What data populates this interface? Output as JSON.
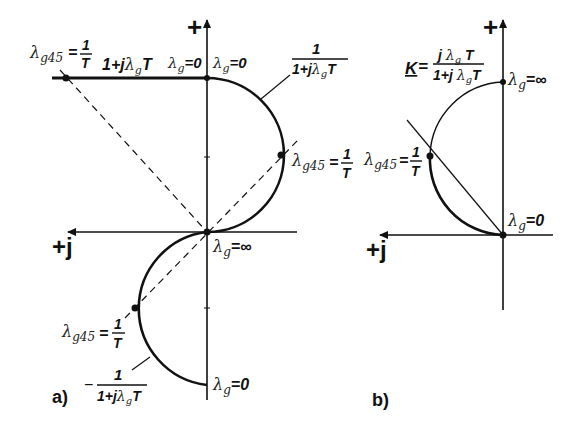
{
  "diagram_a": {
    "caption": "a)",
    "axis_up_label": "+",
    "axis_left_label": "+j",
    "top_line_label": "1+jλgT",
    "top_left_point": {
      "lambda": "λg45",
      "eq": "=",
      "num": "1",
      "den": "T"
    },
    "origin_top_label_left": "λg=0",
    "origin_top_label_right": "λg=0",
    "upper_curve": {
      "num": "1",
      "den": "1+jλgT"
    },
    "upper_point": {
      "lambda": "λg45",
      "eq": "=",
      "num": "1",
      "den": "T"
    },
    "center_label": "λg=∞",
    "lower_point": {
      "lambda": "λg45",
      "eq": "=",
      "num": "1",
      "den": "T"
    },
    "lower_curve": {
      "sign": "−",
      "num": "1",
      "den": "1+jλgT"
    },
    "bottom_label": "λg=0"
  },
  "diagram_b": {
    "caption": "b)",
    "axis_up_label": "+",
    "axis_left_label": "+j",
    "formula": {
      "K": "K",
      "eq": "=",
      "num": "jλgT",
      "den": "1+jλgT"
    },
    "top_label": "λg=∞",
    "point": {
      "lambda": "λg45",
      "eq": "=",
      "num": "1",
      "den": "T"
    },
    "origin_label": "λg=0"
  },
  "colors": {
    "ink": "#111111",
    "background": "#ffffff"
  }
}
